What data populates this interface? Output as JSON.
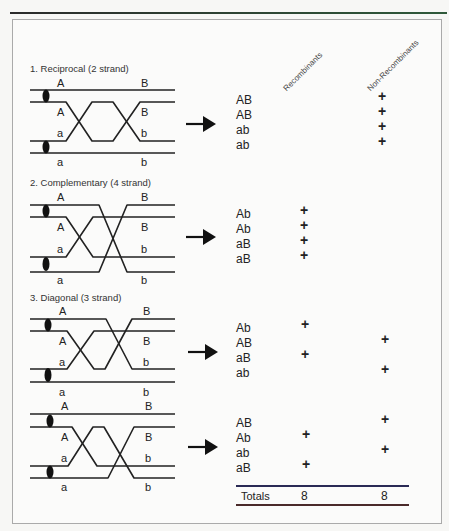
{
  "header": {
    "col_recombinants": "Recombinants",
    "col_nonrecombinants": "Non-Recombinants"
  },
  "panels": [
    {
      "title": "1. Reciprocal (2 strand)",
      "labels_left": [
        "A",
        "A",
        "a",
        "a"
      ],
      "labels_right": [
        "B",
        "B",
        "b",
        "b"
      ],
      "rows": [
        {
          "genotype": "AB",
          "recombinant": "",
          "nonrecombinant": "+"
        },
        {
          "genotype": "AB",
          "recombinant": "",
          "nonrecombinant": "+"
        },
        {
          "genotype": "ab",
          "recombinant": "",
          "nonrecombinant": "+"
        },
        {
          "genotype": "ab",
          "recombinant": "",
          "nonrecombinant": "+"
        }
      ]
    },
    {
      "title": "2. Complementary (4 strand)",
      "labels_left": [
        "A",
        "A",
        "a",
        "a"
      ],
      "labels_right": [
        "B",
        "B",
        "b",
        "b"
      ],
      "rows": [
        {
          "genotype": "Ab",
          "recombinant": "+",
          "nonrecombinant": ""
        },
        {
          "genotype": "Ab",
          "recombinant": "+",
          "nonrecombinant": ""
        },
        {
          "genotype": "aB",
          "recombinant": "+",
          "nonrecombinant": ""
        },
        {
          "genotype": "aB",
          "recombinant": "+",
          "nonrecombinant": ""
        }
      ]
    },
    {
      "title": "3. Diagonal (3 strand)",
      "labels_left": [
        "A",
        "A",
        "a",
        "a"
      ],
      "labels_right": [
        "B",
        "B",
        "b",
        "b"
      ],
      "rows": [
        {
          "genotype": "Ab",
          "recombinant": "+",
          "nonrecombinant": ""
        },
        {
          "genotype": "AB",
          "recombinant": "",
          "nonrecombinant": "+"
        },
        {
          "genotype": "aB",
          "recombinant": "+",
          "nonrecombinant": ""
        },
        {
          "genotype": "ab",
          "recombinant": "",
          "nonrecombinant": "+"
        }
      ]
    },
    {
      "title": "",
      "labels_left": [
        "A",
        "A",
        "a",
        "a"
      ],
      "labels_right": [
        "B",
        "B",
        "b",
        "b"
      ],
      "rows": [
        {
          "genotype": "AB",
          "recombinant": "",
          "nonrecombinant": "+"
        },
        {
          "genotype": "Ab",
          "recombinant": "+",
          "nonrecombinant": ""
        },
        {
          "genotype": "ab",
          "recombinant": "",
          "nonrecombinant": "+"
        },
        {
          "genotype": "aB",
          "recombinant": "+",
          "nonrecombinant": ""
        }
      ]
    }
  ],
  "totals": {
    "label": "Totals",
    "recombinants": "8",
    "nonrecombinants": "8"
  },
  "icons": {
    "arrow": "right-arrow-icon",
    "centromere": "centromere-oval-icon"
  }
}
